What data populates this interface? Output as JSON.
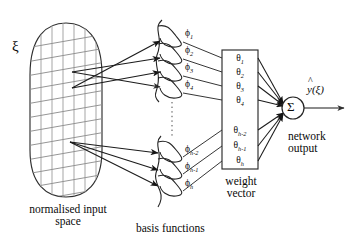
{
  "figure": {
    "input_symbol": "ξ",
    "sum_symbol": "Σ",
    "ellipsis_symbol": "⋮"
  },
  "captions": {
    "input_space_line1": "normalised input",
    "input_space_line2": "space",
    "basis_functions": "basis functions",
    "weight_vector_line1": "weight",
    "weight_vector_line2": "vector",
    "network_output_line1": "network",
    "network_output_line2": "output"
  },
  "output": {
    "label_base": "y",
    "label_arg": "(ξ)",
    "label_full": "ŷ(ξ)"
  },
  "basis_functions": {
    "top_group": [
      {
        "base": "ϕ",
        "sub": "1"
      },
      {
        "base": "ϕ",
        "sub": "2"
      },
      {
        "base": "ϕ",
        "sub": "3"
      },
      {
        "base": "ϕ",
        "sub": "4"
      }
    ],
    "bottom_group": [
      {
        "base": "ϕ",
        "sub": "h-2"
      },
      {
        "base": "ϕ",
        "sub": "h-1"
      },
      {
        "base": "ϕ",
        "sub": "h"
      }
    ]
  },
  "weight_vector": {
    "top_group": [
      {
        "base": "θ",
        "sub": "1"
      },
      {
        "base": "θ",
        "sub": "2"
      },
      {
        "base": "θ",
        "sub": "3"
      },
      {
        "base": "θ",
        "sub": "4"
      }
    ],
    "bottom_group": [
      {
        "base": "θ",
        "sub": "h-2"
      },
      {
        "base": "θ",
        "sub": "h-1"
      },
      {
        "base": "θ",
        "sub": "h"
      }
    ]
  },
  "colors": {
    "ink": "#0a0a0a",
    "line": "#2a2a2a",
    "grid_vertical": "#a8a8a8",
    "grid_slanted": "#8d8d8d",
    "background": "#ffffff"
  }
}
